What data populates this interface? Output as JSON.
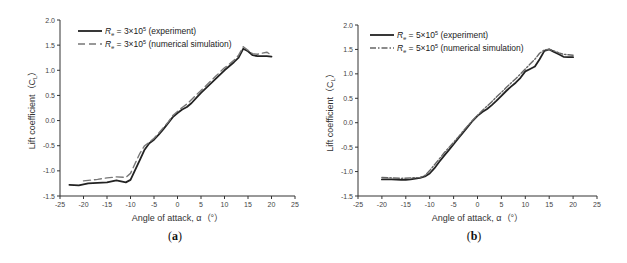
{
  "chart_data": [
    {
      "id": "a",
      "type": "line",
      "caption": "(a)",
      "caption_letter": "a",
      "title": "",
      "xlabel": "Angle of attack, α（°）",
      "ylabel": "Lift coefficient（C_L）",
      "xlim": [
        -25,
        25
      ],
      "ylim": [
        -1.5,
        2.0
      ],
      "xticks": [
        -25,
        -20,
        -15,
        -10,
        -5,
        0,
        5,
        10,
        15,
        20,
        25
      ],
      "yticks": [
        -1.5,
        -1.0,
        -0.5,
        0.0,
        0.5,
        1.0,
        1.5,
        2.0
      ],
      "grid": false,
      "legend_position": "upper left",
      "series": [
        {
          "name": "Re = 3×10^5 (experiment)",
          "legend_prefix": "R",
          "legend_sub": "e",
          "legend_eq": " = 3×10",
          "legend_sup": "5",
          "legend_suffix": " (experiment)",
          "style": "solid",
          "color": "#222222",
          "x": [
            -23,
            -21,
            -19,
            -17,
            -15,
            -13,
            -12,
            -11,
            -10,
            -9,
            -8,
            -7,
            -6,
            -5,
            -4,
            -3,
            -2,
            -1,
            0,
            1,
            2,
            3,
            4,
            5,
            6,
            7,
            8,
            9,
            10,
            11,
            12,
            13,
            14,
            15,
            16,
            17,
            18,
            19,
            20
          ],
          "y": [
            -1.28,
            -1.29,
            -1.25,
            -1.24,
            -1.23,
            -1.19,
            -1.21,
            -1.23,
            -1.18,
            -0.98,
            -0.78,
            -0.58,
            -0.45,
            -0.38,
            -0.28,
            -0.17,
            -0.05,
            0.07,
            0.15,
            0.22,
            0.27,
            0.35,
            0.45,
            0.55,
            0.64,
            0.73,
            0.82,
            0.91,
            1.0,
            1.08,
            1.16,
            1.25,
            1.43,
            1.38,
            1.3,
            1.28,
            1.28,
            1.28,
            1.27
          ]
        },
        {
          "name": "Re = 3×10^5 (numerical simulation)",
          "legend_prefix": "R",
          "legend_sub": "e",
          "legend_eq": " = 3×10",
          "legend_sup": "5",
          "legend_suffix": " (numerical simulation)",
          "style": "dashed",
          "color": "#777777",
          "x": [
            -20,
            -17,
            -15,
            -13,
            -11,
            -10,
            -9,
            -8,
            -7,
            -6,
            -5,
            -4,
            -3,
            -2,
            -1,
            0,
            1,
            2,
            3,
            4,
            5,
            6,
            7,
            8,
            9,
            10,
            11,
            12,
            13,
            14,
            15,
            16,
            17,
            18,
            19,
            20
          ],
          "y": [
            -1.2,
            -1.17,
            -1.14,
            -1.12,
            -1.13,
            -1.05,
            -0.85,
            -0.65,
            -0.5,
            -0.43,
            -0.35,
            -0.25,
            -0.14,
            -0.03,
            0.1,
            0.18,
            0.26,
            0.33,
            0.42,
            0.51,
            0.6,
            0.69,
            0.78,
            0.87,
            0.96,
            1.05,
            1.12,
            1.2,
            1.3,
            1.47,
            1.4,
            1.33,
            1.32,
            1.34,
            1.36,
            1.3
          ]
        }
      ]
    },
    {
      "id": "b",
      "type": "line",
      "caption": "(b)",
      "caption_letter": "b",
      "title": "",
      "xlabel": "Angle of attack, α（°）",
      "ylabel": "Lift coefficient（C_L）",
      "xlim": [
        -25,
        25
      ],
      "ylim": [
        -1.5,
        2.0
      ],
      "xticks": [
        -25,
        -20,
        -15,
        -10,
        -5,
        0,
        5,
        10,
        15,
        20,
        25
      ],
      "yticks": [
        -1.5,
        -1.0,
        -0.5,
        0.0,
        0.5,
        1.0,
        1.5,
        2.0
      ],
      "grid": false,
      "legend_position": "upper left",
      "series": [
        {
          "name": "Re = 5×10^5 (experiment)",
          "legend_prefix": "R",
          "legend_sub": "e",
          "legend_eq": " = 5×10",
          "legend_sup": "5",
          "legend_suffix": " (experiment)",
          "style": "solid",
          "color": "#222222",
          "x": [
            -20,
            -18,
            -16,
            -15,
            -14,
            -12,
            -11,
            -10,
            -9,
            -8,
            -7,
            -6,
            -5,
            -4,
            -3,
            -2,
            -1,
            0,
            1,
            2,
            3,
            4,
            5,
            6,
            7,
            8,
            9,
            10,
            11,
            12,
            13,
            14,
            15,
            16,
            17,
            18,
            19,
            20
          ],
          "y": [
            -1.16,
            -1.16,
            -1.17,
            -1.17,
            -1.16,
            -1.13,
            -1.1,
            -1.04,
            -0.93,
            -0.8,
            -0.68,
            -0.56,
            -0.44,
            -0.32,
            -0.2,
            -0.08,
            0.04,
            0.14,
            0.22,
            0.28,
            0.36,
            0.45,
            0.55,
            0.65,
            0.74,
            0.82,
            0.92,
            1.05,
            1.1,
            1.15,
            1.3,
            1.47,
            1.5,
            1.45,
            1.4,
            1.35,
            1.34,
            1.34
          ]
        },
        {
          "name": "Re = 5×10^5 (numerical simulation)",
          "legend_prefix": "R",
          "legend_sub": "e",
          "legend_eq": " = 5×10",
          "legend_sup": "5",
          "legend_suffix": " (numerical simulation)",
          "style": "dashdot",
          "color": "#666666",
          "x": [
            -20,
            -18,
            -16,
            -14,
            -12,
            -11,
            -10,
            -9,
            -8,
            -7,
            -6,
            -5,
            -4,
            -3,
            -2,
            -1,
            0,
            1,
            2,
            3,
            4,
            5,
            6,
            7,
            8,
            9,
            10,
            11,
            12,
            13,
            14,
            15,
            16,
            17,
            18,
            19,
            20
          ],
          "y": [
            -1.12,
            -1.13,
            -1.14,
            -1.13,
            -1.12,
            -1.08,
            -0.98,
            -0.86,
            -0.74,
            -0.62,
            -0.51,
            -0.4,
            -0.29,
            -0.17,
            -0.06,
            0.05,
            0.15,
            0.25,
            0.34,
            0.43,
            0.53,
            0.62,
            0.72,
            0.81,
            0.9,
            1.0,
            1.1,
            1.2,
            1.3,
            1.42,
            1.49,
            1.5,
            1.47,
            1.43,
            1.4,
            1.39,
            1.38
          ]
        }
      ]
    }
  ]
}
